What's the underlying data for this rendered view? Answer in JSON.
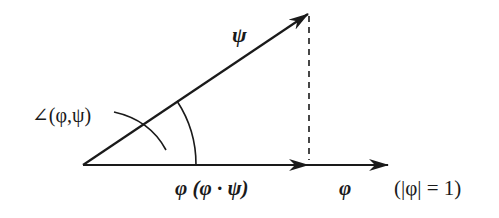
{
  "diagram": {
    "type": "vector-projection",
    "colors": {
      "stroke": "#1a1a1a",
      "background": "#ffffff"
    },
    "vectors": {
      "psi": {
        "label": "ψ"
      },
      "projection": {
        "label": "φ (φ · ψ)"
      },
      "phi": {
        "label": "φ"
      }
    },
    "angle": {
      "label": "∠(φ,ψ)"
    },
    "unit_note": {
      "label": "(|φ| = 1)"
    }
  }
}
